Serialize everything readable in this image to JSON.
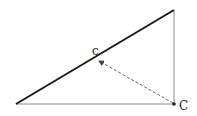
{
  "diagram": {
    "labels": {
      "foot_point": "c",
      "corner_point": "C"
    },
    "colors": {
      "hypotenuse": "#1a1a1a",
      "legs": "#888888",
      "arrow": "#666666",
      "point": "#222222"
    }
  }
}
